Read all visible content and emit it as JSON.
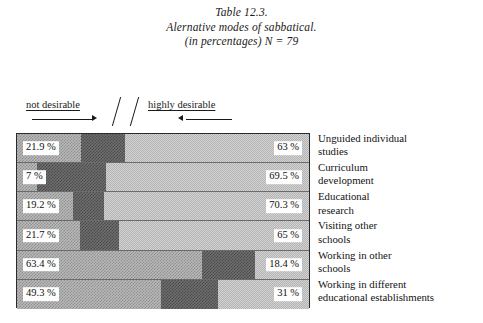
{
  "title": {
    "line1": "Table 12.3.",
    "line2": "Alernative modes of sabbatical.",
    "line3": "(in percentages) N = 79"
  },
  "scale": {
    "left_label": "not desirable",
    "right_label": "highly desirable",
    "separator": "//"
  },
  "chart_data": {
    "type": "bar",
    "orientation": "horizontal",
    "stacked": true,
    "title": "Alernative modes of sabbatical.",
    "subtitle": "(in percentages) N = 79",
    "table_number": "Table 12.3.",
    "sample_size": 79,
    "xlabel": "",
    "ylabel": "",
    "xlim": [
      0,
      100
    ],
    "grid": false,
    "legend_position": "top",
    "categories": [
      "Unguided individual studies",
      "Curriculum development",
      "Educational research",
      "Visiting other schools",
      "Working in other schools",
      "Working in different educational establishments"
    ],
    "series": [
      {
        "name": "not desirable",
        "pattern": "cross-hatch",
        "color": "#b9b9b9",
        "values": [
          21.9,
          7.0,
          19.2,
          21.7,
          63.4,
          49.3
        ]
      },
      {
        "name": "middle",
        "pattern": "dark-checker",
        "color": "#6f6f6f",
        "values": [
          15.1,
          23.5,
          10.5,
          13.3,
          18.2,
          19.7
        ]
      },
      {
        "name": "highly desirable",
        "pattern": "light-dither",
        "color": "#d2d2d2",
        "values": [
          63.0,
          69.5,
          70.3,
          65.0,
          18.4,
          31.0
        ]
      }
    ],
    "left_labels": [
      "21.9 %",
      "7 %",
      "19.2 %",
      "21.7 %",
      "63.4 %",
      "49.3 %"
    ],
    "right_labels": [
      "63 %",
      "69.5 %",
      "70.3 %",
      "65 %",
      "18.4 %",
      "31 %"
    ]
  },
  "rows": [
    {
      "left_pct": "21.9 %",
      "right_pct": "63 %",
      "seg1": 21.9,
      "seg2": 15.1,
      "seg3": 63.0,
      "label_line1": "Unguided individual",
      "label_line2": "studies"
    },
    {
      "left_pct": "7 %",
      "right_pct": "69.5 %",
      "seg1": 7.0,
      "seg2": 23.5,
      "seg3": 69.5,
      "label_line1": "Curriculum",
      "label_line2": "development"
    },
    {
      "left_pct": "19.2 %",
      "right_pct": "70.3 %",
      "seg1": 19.2,
      "seg2": 10.5,
      "seg3": 70.3,
      "label_line1": "Educational",
      "label_line2": "research"
    },
    {
      "left_pct": "21.7 %",
      "right_pct": "65 %",
      "seg1": 21.7,
      "seg2": 13.3,
      "seg3": 65.0,
      "label_line1": "Visiting other",
      "label_line2": "schools"
    },
    {
      "left_pct": "63.4 %",
      "right_pct": "18.4 %",
      "seg1": 63.4,
      "seg2": 18.2,
      "seg3": 18.4,
      "label_line1": "Working in other",
      "label_line2": "schools"
    },
    {
      "left_pct": "49.3 %",
      "right_pct": "31 %",
      "seg1": 49.3,
      "seg2": 19.7,
      "seg3": 31.0,
      "label_line1": "Working in different",
      "label_line2": "educational establishments"
    }
  ]
}
